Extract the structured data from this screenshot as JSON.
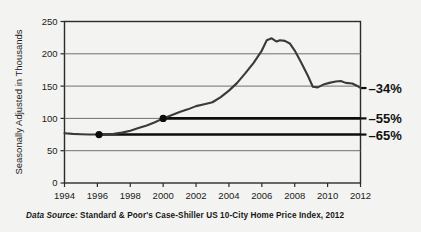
{
  "chart_data": {
    "type": "line",
    "title": "",
    "xlabel": "",
    "ylabel": "Seasonally Adjusted in Thousands",
    "xlim": [
      1994,
      2012
    ],
    "ylim": [
      0,
      250
    ],
    "grid": true,
    "legend": false,
    "x_ticks": [
      "1994",
      "1996",
      "1998",
      "2000",
      "2002",
      "2004",
      "2006",
      "2008",
      "2010",
      "2012"
    ],
    "y_ticks": [
      "0",
      "50",
      "100",
      "150",
      "200",
      "250"
    ],
    "series": [
      {
        "name": "Case-Shiller US 10-City Home Price Index",
        "x": [
          1994.0,
          1994.5,
          1995.0,
          1995.5,
          1996.0,
          1996.5,
          1997.0,
          1997.5,
          1998.0,
          1998.5,
          1999.0,
          1999.5,
          2000.0,
          2000.5,
          2001.0,
          2001.5,
          2002.0,
          2002.5,
          2003.0,
          2003.5,
          2004.0,
          2004.5,
          2005.0,
          2005.5,
          2006.0,
          2006.3,
          2006.6,
          2006.9,
          2007.1,
          2007.4,
          2007.7,
          2008.0,
          2008.4,
          2008.8,
          2009.1,
          2009.4,
          2009.8,
          2010.1,
          2010.5,
          2010.8,
          2011.1,
          2011.5,
          2011.9,
          2012.0
        ],
        "y": [
          77,
          76,
          75.5,
          75,
          75,
          75,
          76,
          78,
          81,
          85,
          89,
          94,
          100,
          105,
          110,
          114,
          119,
          122,
          125,
          133,
          143,
          155,
          170,
          186,
          205,
          221,
          224,
          219,
          221,
          220,
          216,
          205,
          186,
          166,
          149,
          148,
          153,
          155,
          157,
          158,
          155,
          154,
          149,
          147
        ]
      }
    ],
    "markers": [
      {
        "label": "1996 reference point",
        "x": 1996.1,
        "y": 75
      },
      {
        "label": "2000 reference point",
        "x": 2000.0,
        "y": 100
      }
    ],
    "reference_lines": [
      {
        "label": "-34%",
        "y": 147,
        "style": "axis-tick",
        "from_x": 2012.0
      },
      {
        "label": "-55%",
        "y": 100,
        "style": "thick",
        "from_x": 2000.0
      },
      {
        "label": "-65%",
        "y": 75,
        "style": "thick",
        "from_x": 1996.1
      }
    ],
    "annotations": [
      {
        "text": "–34%",
        "value": -34,
        "at_y": 147
      },
      {
        "text": "–55%",
        "value": -55,
        "at_y": 100
      },
      {
        "text": "–65%",
        "value": -65,
        "at_y": 75
      }
    ]
  },
  "caption": {
    "prefix": "Data Source:",
    "text": "Standard & Poor's Case-Shiller US 10-City Home Price Index, 2012"
  },
  "colors": {
    "background": "#f3f3f1",
    "axis": "#2b2b2b",
    "gridline": "#6f6f6f",
    "series": "#3a3a3a",
    "reference": "#0d0d0d",
    "text": "#1a1a1a"
  }
}
